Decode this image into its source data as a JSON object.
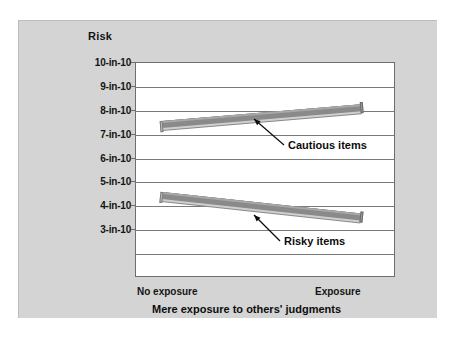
{
  "figure": {
    "background_color": "#d4d4d4",
    "plot_background_color": "#ffffff",
    "band_color": "#8a8a8a",
    "axis_color": "#6e6e6e"
  },
  "chart_data": {
    "type": "line",
    "title": "Risk",
    "xlabel": "Mere exposure to others' judgments",
    "ylabel": "Risk",
    "x": [
      "No exposure",
      "Exposure"
    ],
    "xtick_labels": [
      "No exposure",
      "Exposure"
    ],
    "ytick_labels": [
      "10-in-10",
      "9-in-10",
      "8-in-10",
      "7-in-10",
      "6-in-10",
      "5-in-10",
      "4-in-10",
      "3-in-10"
    ],
    "ytick_values": [
      10,
      9,
      8,
      7,
      6,
      5,
      4,
      3
    ],
    "ylim": [
      1,
      10
    ],
    "grid": true,
    "legend": "none",
    "series": [
      {
        "name": "Cautious items",
        "values": [
          7.4,
          8.1
        ],
        "annotation": "Cautious items"
      },
      {
        "name": "Risky items",
        "values": [
          4.4,
          3.5
        ],
        "annotation": "Risky items"
      }
    ],
    "annotations": [
      {
        "text": "Cautious items",
        "points_to": "Cautious items line"
      },
      {
        "text": "Risky items",
        "points_to": "Risky items line"
      }
    ]
  },
  "axis": {
    "y_title": "Risk",
    "x_title": "Mere exposure to others' judgments",
    "x_left_label": "No exposure",
    "x_right_label": "Exposure",
    "y_ticks": [
      {
        "label": "10-in-10"
      },
      {
        "label": "9-in-10"
      },
      {
        "label": "8-in-10"
      },
      {
        "label": "7-in-10"
      },
      {
        "label": "6-in-10"
      },
      {
        "label": "5-in-10"
      },
      {
        "label": "4-in-10"
      },
      {
        "label": "3-in-10"
      }
    ]
  },
  "series_labels": {
    "cautious": "Cautious items",
    "risky": "Risky items"
  }
}
